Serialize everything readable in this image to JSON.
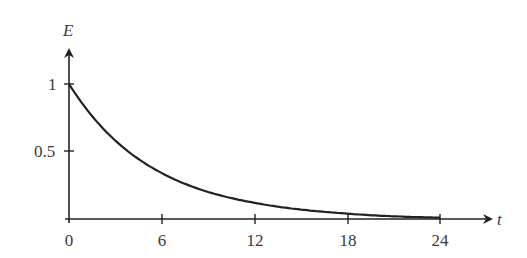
{
  "chart_data": {
    "type": "line",
    "title": "",
    "xlabel": "t",
    "ylabel": "E",
    "x_ticks": [
      "0",
      "6",
      "12",
      "18",
      "24"
    ],
    "y_ticks": [
      "0.5",
      "1"
    ],
    "xlim": [
      0,
      24
    ],
    "ylim": [
      0,
      1
    ],
    "grid": false,
    "legend": null,
    "series": [
      {
        "name": "E(t)",
        "description": "exponential decay starting at E=1",
        "x": [
          0,
          3,
          6,
          9,
          12,
          15,
          18,
          21,
          24
        ],
        "values": [
          1.0,
          0.58,
          0.34,
          0.2,
          0.12,
          0.07,
          0.04,
          0.02,
          0.01
        ]
      }
    ]
  },
  "axes": {
    "x_label": "t",
    "y_label": "E",
    "x_tick_labels": [
      "0",
      "6",
      "12",
      "18",
      "24"
    ],
    "y_tick_labels": [
      "1",
      "0.5"
    ]
  }
}
